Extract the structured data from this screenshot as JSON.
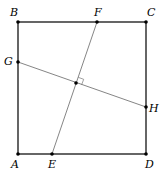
{
  "diagram": {
    "colors": {
      "square": "#000000",
      "segments": "#777777",
      "points": "#000000"
    },
    "points": {
      "A": {
        "label": "A",
        "x": 18,
        "y": 154,
        "lx": 15,
        "ly": 168
      },
      "B": {
        "label": "B",
        "x": 18,
        "y": 22,
        "lx": 14,
        "ly": 16
      },
      "C": {
        "label": "C",
        "x": 146,
        "y": 22,
        "lx": 151,
        "ly": 16
      },
      "D": {
        "label": "D",
        "x": 146,
        "y": 154,
        "lx": 149,
        "ly": 168
      },
      "E": {
        "label": "E",
        "x": 52,
        "y": 154,
        "lx": 52,
        "ly": 168
      },
      "F": {
        "label": "F",
        "x": 97,
        "y": 22,
        "lx": 98,
        "ly": 16
      },
      "G": {
        "label": "G",
        "x": 18,
        "y": 62,
        "lx": 10,
        "ly": 65
      },
      "H": {
        "label": "H",
        "x": 146,
        "y": 107,
        "lx": 154,
        "ly": 112
      },
      "O": {
        "label": "",
        "x": 76,
        "y": 83
      }
    },
    "segments": [
      "AB",
      "BC",
      "CD",
      "DA",
      "EF",
      "GH"
    ],
    "annotations": [
      "right angle at intersection of EF and GH"
    ]
  }
}
